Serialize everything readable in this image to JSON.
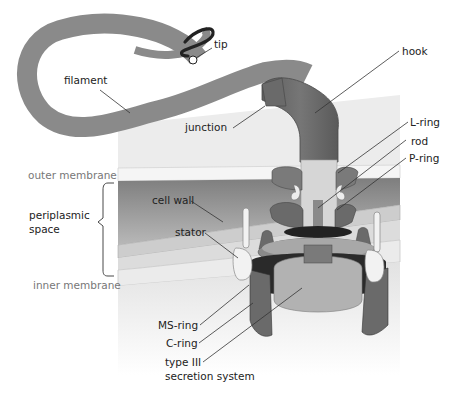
{
  "labels": {
    "tip": "tip",
    "filament": "filament",
    "hook": "hook",
    "junction": "junction",
    "l_ring": "L-ring",
    "rod": "rod",
    "p_ring": "P-ring",
    "outer_membrane": "outer membrane",
    "periplasmic_space_line1": "periplasmic",
    "periplasmic_space_line2": "space",
    "cell_wall": "cell wall",
    "stator": "stator",
    "inner_membrane": "inner membrane",
    "ms_ring": "MS-ring",
    "c_ring": "C-ring",
    "type3_line1": "type III",
    "type3_line2": "secretion system"
  },
  "colors": {
    "filament": "#8a8a8a",
    "tip": "#222222",
    "hook": "#6e6e6e",
    "background_block": "#ececec",
    "outer_membrane": "#f4f4f4",
    "periplasm_dark": "#8c8c8c",
    "cell_wall": "#cfcfcf",
    "inner_membrane": "#dedede",
    "cytoplasm": "#e6e6e6",
    "rings": "#7a7a7a",
    "rod": "#d8d8d8",
    "stator": "#efefef",
    "c_ring_dark": "#2a2a2a",
    "c_ring": "#6a6a6a",
    "secretion": "#b0b0b0",
    "leader": "#333333",
    "text": "#222222",
    "text_gray": "#777777"
  }
}
